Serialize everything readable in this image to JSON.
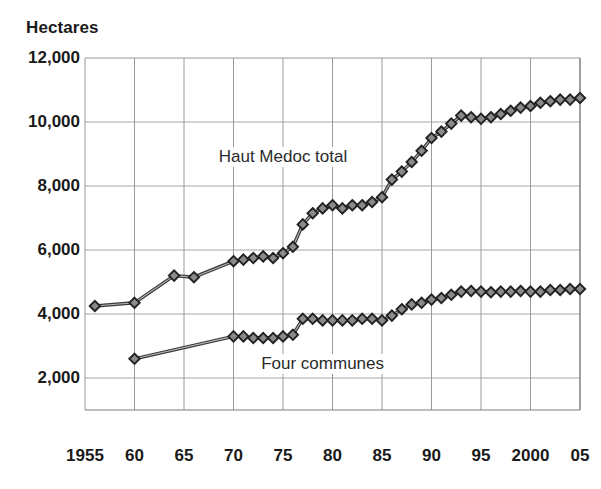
{
  "chart_data": {
    "type": "line",
    "title": "",
    "ylabel": "Hectares",
    "xlabel": "",
    "ylim": [
      0,
      12000
    ],
    "xlim": [
      1955,
      2005
    ],
    "grid": true,
    "legend_position": "inline-annotations",
    "y_ticks": [
      "12,000",
      "10,000",
      "8,000",
      "6,000",
      "4,000",
      "2,000"
    ],
    "y_tick_values": [
      12000,
      10000,
      8000,
      6000,
      4000,
      2000
    ],
    "x_ticks": [
      "1955",
      "60",
      "65",
      "70",
      "75",
      "80",
      "85",
      "90",
      "95",
      "2000",
      "05"
    ],
    "x_tick_values": [
      1955,
      1960,
      1965,
      1970,
      1975,
      1980,
      1985,
      1990,
      1995,
      2000,
      2005
    ],
    "marker": "diamond",
    "line_color": "#3a3a3a",
    "marker_fill": "#8a8a8a",
    "marker_edge": "#222222",
    "grid_color": "#9a9a9a",
    "series": [
      {
        "name": "Haut Medoc total",
        "label_x": 1975,
        "label_y": 8900,
        "x": [
          1956,
          1960,
          1964,
          1966,
          1970,
          1971,
          1972,
          1973,
          1974,
          1975,
          1976,
          1977,
          1978,
          1979,
          1980,
          1981,
          1982,
          1983,
          1984,
          1985,
          1986,
          1987,
          1988,
          1989,
          1990,
          1991,
          1992,
          1993,
          1994,
          1995,
          1996,
          1997,
          1998,
          1999,
          2000,
          2001,
          2002,
          2003,
          2004,
          2005
        ],
        "values": [
          4250,
          4350,
          5200,
          5150,
          5650,
          5700,
          5750,
          5800,
          5750,
          5900,
          6100,
          6800,
          7150,
          7300,
          7400,
          7300,
          7400,
          7400,
          7500,
          7650,
          8200,
          8450,
          8750,
          9100,
          9500,
          9700,
          9950,
          10200,
          10150,
          10100,
          10150,
          10250,
          10350,
          10450,
          10500,
          10600,
          10650,
          10700,
          10700,
          10750
        ]
      },
      {
        "name": "Four communes",
        "label_x": 1979,
        "label_y": 2450,
        "x": [
          1960,
          1970,
          1971,
          1972,
          1973,
          1974,
          1975,
          1976,
          1977,
          1978,
          1979,
          1980,
          1981,
          1982,
          1983,
          1984,
          1985,
          1986,
          1987,
          1988,
          1989,
          1990,
          1991,
          1992,
          1993,
          1994,
          1995,
          1996,
          1997,
          1998,
          1999,
          2000,
          2001,
          2002,
          2003,
          2004,
          2005
        ],
        "values": [
          2600,
          3300,
          3300,
          3250,
          3250,
          3250,
          3300,
          3350,
          3850,
          3850,
          3800,
          3800,
          3800,
          3800,
          3850,
          3850,
          3800,
          3950,
          4150,
          4300,
          4350,
          4450,
          4500,
          4600,
          4700,
          4720,
          4700,
          4680,
          4700,
          4700,
          4720,
          4700,
          4700,
          4750,
          4750,
          4780,
          4780
        ]
      }
    ]
  }
}
